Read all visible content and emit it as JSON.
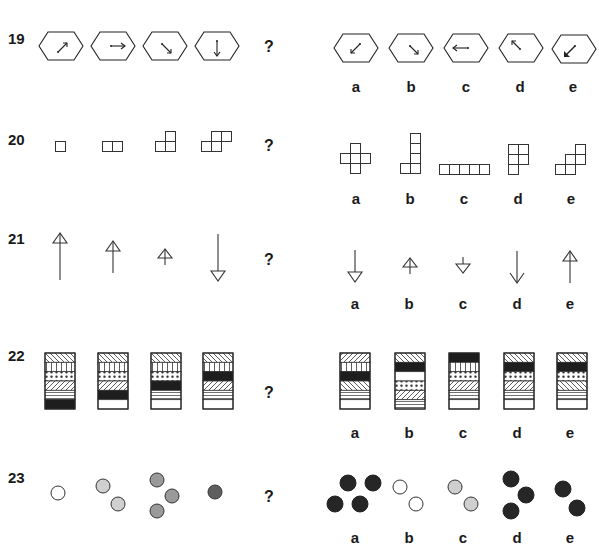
{
  "questions": [
    {
      "number": "19",
      "question_mark": "?",
      "sequence_description": [
        "hexagon arrow up-right",
        "hexagon arrow right",
        "hexagon arrow down-right",
        "hexagon arrow down"
      ],
      "options": [
        {
          "label": "a",
          "description": "hexagon arrow down-left"
        },
        {
          "label": "b",
          "description": "hexagon arrow down-right"
        },
        {
          "label": "c",
          "description": "hexagon arrow left (tail at right)"
        },
        {
          "label": "d",
          "description": "hexagon arrow up-left"
        },
        {
          "label": "e",
          "description": "hexagon arrow down-left (bold head)"
        }
      ]
    },
    {
      "number": "20",
      "question_mark": "?",
      "sequence_description": [
        "1 square",
        "2 squares horizontal",
        "3 squares L-shape",
        "4 squares step"
      ],
      "options": [
        {
          "label": "a",
          "description": "5 squares plus/cross"
        },
        {
          "label": "b",
          "description": "5 squares L tall"
        },
        {
          "label": "c",
          "description": "5 squares row"
        },
        {
          "label": "d",
          "description": "5 squares P-shape"
        },
        {
          "label": "e",
          "description": "5 squares staircase"
        }
      ]
    },
    {
      "number": "21",
      "question_mark": "?",
      "sequence_description": [
        "long arrow up",
        "medium arrow up",
        "short arrow up",
        "long arrow down"
      ],
      "options": [
        {
          "label": "a",
          "description": "medium arrow down"
        },
        {
          "label": "b",
          "description": "short arrow up"
        },
        {
          "label": "c",
          "description": "short arrow down"
        },
        {
          "label": "d",
          "description": "long arrow down (open head)"
        },
        {
          "label": "e",
          "description": "medium arrow up"
        }
      ]
    },
    {
      "number": "22",
      "question_mark": "?",
      "sequence": [
        [
          "diag-back",
          "vertical",
          "dots",
          "diag-fwd",
          "horizontal",
          "black"
        ],
        [
          "diag-back",
          "vertical",
          "dots",
          "diag-fwd",
          "black",
          "white"
        ],
        [
          "diag-back",
          "vertical",
          "dots",
          "black",
          "horizontal",
          "white"
        ],
        [
          "diag-back",
          "vertical",
          "black",
          "diag-fwd",
          "horizontal",
          "white"
        ]
      ],
      "options": [
        {
          "label": "a",
          "bands": [
            "diag-fwd",
            "vertical",
            "black",
            "diag-back",
            "horizontal",
            "white"
          ]
        },
        {
          "label": "b",
          "bands": [
            "diag-back",
            "black",
            "white",
            "dots",
            "diag-fwd",
            "horizontal"
          ]
        },
        {
          "label": "c",
          "bands": [
            "black",
            "vertical",
            "dots",
            "diag-fwd",
            "horizontal",
            "white"
          ]
        },
        {
          "label": "d",
          "bands": [
            "diag-back",
            "black",
            "dots",
            "diag-fwd",
            "horizontal",
            "white"
          ]
        },
        {
          "label": "e",
          "bands": [
            "diag-back",
            "black",
            "dots",
            "diag-back",
            "horizontal",
            "white"
          ]
        }
      ]
    },
    {
      "number": "23",
      "question_mark": "?",
      "sequence_description": [
        "1 white circle",
        "2 light grey circles",
        "3 mid grey circles",
        "1 dark grey circle"
      ],
      "options": [
        {
          "label": "a",
          "description": "4 black circles"
        },
        {
          "label": "b",
          "description": "2 white circles"
        },
        {
          "label": "c",
          "description": "2 light grey circles"
        },
        {
          "label": "d",
          "description": "3 black circles"
        },
        {
          "label": "e",
          "description": "2 black circles"
        }
      ]
    }
  ],
  "colors": {
    "ink": "#1a1a1a",
    "white": "#ffffff",
    "light_grey": "#cfcfcf",
    "mid_grey": "#9a9a9a",
    "dark_grey": "#5e5e5e",
    "black": "#262626"
  }
}
